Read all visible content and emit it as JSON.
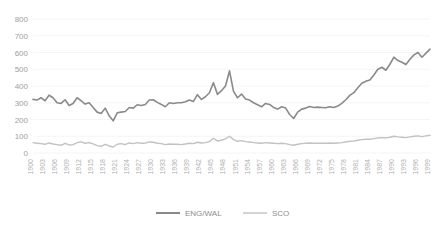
{
  "chart_data": {
    "type": "line",
    "title": "",
    "subtitle": "",
    "xlabel": "",
    "ylabel": "",
    "xlim": [
      1900,
      1999
    ],
    "ylim": [
      0,
      800
    ],
    "grid": true,
    "legend_position": "bottom",
    "ytick_labels": [
      "800",
      "700",
      "600",
      "500",
      "400",
      "300",
      "200",
      "100",
      "0"
    ],
    "ytick_values": [
      800,
      700,
      600,
      500,
      400,
      300,
      200,
      100,
      0
    ],
    "xtick_labels": [
      "1900",
      "1903",
      "1906",
      "1909",
      "1912",
      "1915",
      "1918",
      "1921",
      "1924",
      "1927",
      "1930",
      "1933",
      "1936",
      "1939",
      "1942",
      "1945",
      "1948",
      "1951",
      "1954",
      "1957",
      "1960",
      "1963",
      "1966",
      "1969",
      "1972",
      "1975",
      "1978",
      "1981",
      "1984",
      "1987",
      "1990",
      "1993",
      "1996",
      "1999"
    ],
    "xtick_values": [
      1900,
      1903,
      1906,
      1909,
      1912,
      1915,
      1918,
      1921,
      1924,
      1927,
      1930,
      1933,
      1936,
      1939,
      1942,
      1945,
      1948,
      1951,
      1954,
      1957,
      1960,
      1963,
      1966,
      1969,
      1972,
      1975,
      1978,
      1981,
      1984,
      1987,
      1990,
      1993,
      1996,
      1999
    ],
    "x": [
      1900,
      1901,
      1902,
      1903,
      1904,
      1905,
      1906,
      1907,
      1908,
      1909,
      1910,
      1911,
      1912,
      1913,
      1914,
      1915,
      1916,
      1917,
      1918,
      1919,
      1920,
      1921,
      1922,
      1923,
      1924,
      1925,
      1926,
      1927,
      1928,
      1929,
      1930,
      1931,
      1932,
      1933,
      1934,
      1935,
      1936,
      1937,
      1938,
      1939,
      1940,
      1941,
      1942,
      1943,
      1944,
      1945,
      1946,
      1947,
      1948,
      1949,
      1950,
      1951,
      1952,
      1953,
      1954,
      1955,
      1956,
      1957,
      1958,
      1959,
      1960,
      1961,
      1962,
      1963,
      1964,
      1965,
      1966,
      1967,
      1968,
      1969,
      1970,
      1971,
      1972,
      1973,
      1974,
      1975,
      1976,
      1977,
      1978,
      1979,
      1980,
      1981,
      1982,
      1983,
      1984,
      1985,
      1986,
      1987,
      1988,
      1989,
      1990,
      1991,
      1992,
      1993,
      1994,
      1995,
      1996,
      1997,
      1998,
      1999
    ],
    "series": [
      {
        "name": "ENG/WAL",
        "color": "#8a8a8a",
        "width": 1.6,
        "values": [
          320,
          316,
          330,
          312,
          345,
          330,
          300,
          296,
          318,
          284,
          296,
          330,
          312,
          292,
          300,
          272,
          244,
          236,
          268,
          222,
          192,
          240,
          244,
          248,
          272,
          268,
          288,
          284,
          290,
          316,
          318,
          302,
          290,
          276,
          300,
          296,
          300,
          300,
          306,
          316,
          308,
          348,
          320,
          336,
          360,
          420,
          350,
          372,
          400,
          490,
          368,
          330,
          352,
          322,
          316,
          300,
          288,
          276,
          296,
          290,
          272,
          262,
          276,
          268,
          230,
          206,
          244,
          262,
          268,
          278,
          272,
          274,
          272,
          270,
          276,
          272,
          280,
          296,
          318,
          344,
          360,
          390,
          416,
          428,
          436,
          466,
          500,
          512,
          494,
          530,
          572,
          552,
          542,
          528,
          560,
          586,
          600,
          572,
          596,
          620
        ]
      }
    ]
  },
  "chart_data_extra": {
    "series2": {
      "name": "SCO",
      "color": "#c2c2c2",
      "width": 1.4,
      "values": [
        62,
        58,
        56,
        52,
        60,
        54,
        50,
        46,
        58,
        48,
        50,
        62,
        66,
        58,
        62,
        54,
        44,
        40,
        52,
        42,
        36,
        52,
        56,
        50,
        60,
        56,
        62,
        58,
        60,
        66,
        64,
        58,
        56,
        50,
        54,
        52,
        52,
        50,
        54,
        58,
        56,
        64,
        60,
        62,
        68,
        88,
        72,
        76,
        84,
        100,
        80,
        70,
        74,
        68,
        66,
        62,
        60,
        58,
        62,
        60,
        58,
        56,
        58,
        56,
        50,
        46,
        52,
        56,
        58,
        60,
        58,
        58,
        58,
        58,
        60,
        58,
        60,
        62,
        66,
        70,
        72,
        76,
        80,
        82,
        82,
        86,
        90,
        92,
        90,
        94,
        100,
        96,
        94,
        92,
        96,
        100,
        102,
        98,
        102,
        106
      ]
    }
  },
  "legend": {
    "items": [
      {
        "label": "ENG/WAL",
        "color": "#8a8a8a"
      },
      {
        "label": "SCO",
        "color": "#c2c2c2"
      }
    ]
  }
}
